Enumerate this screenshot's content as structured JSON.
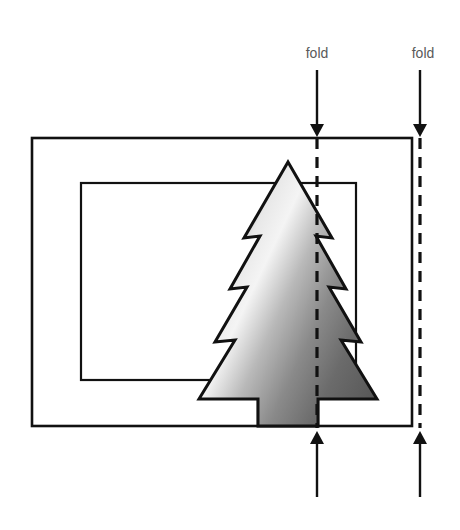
{
  "diagram": {
    "background_color": "#ffffff",
    "stroke_color": "#111111",
    "label_color": "#5a5a5a",
    "labels": [
      {
        "name": "fold-label-left",
        "text": "fold",
        "x": 317,
        "y": 58
      },
      {
        "name": "fold-label-right",
        "text": "fold",
        "x": 423,
        "y": 58
      }
    ],
    "fold_lines": [
      {
        "name": "fold-line-left",
        "x": 317,
        "y_top": 138,
        "y_bottom": 428,
        "dash": "10 7"
      },
      {
        "name": "fold-line-right",
        "x": 420,
        "y_top": 138,
        "y_bottom": 428,
        "dash": "10 7"
      }
    ],
    "arrows": {
      "top": [
        {
          "name": "fold-arrow-top-left",
          "x": 317,
          "y_start": 70,
          "y_end": 137
        },
        {
          "name": "fold-arrow-top-right",
          "x": 420,
          "y_start": 70,
          "y_end": 137
        }
      ],
      "bottom": [
        {
          "name": "fold-arrow-bottom-left",
          "x": 317,
          "y_start": 497,
          "y_end": 430
        },
        {
          "name": "fold-arrow-bottom-right",
          "x": 420,
          "y_start": 497,
          "y_end": 430
        }
      ]
    },
    "outer_rectangle": {
      "x": 32,
      "y": 138,
      "width": 380,
      "height": 288
    },
    "inner_rectangle": {
      "x": 81,
      "y": 183,
      "width": 275,
      "height": 197
    },
    "tree": {
      "tiers": 5,
      "trunk": {
        "x": 258,
        "y": 372,
        "width": 60,
        "height": 54
      },
      "apex": {
        "x": 288,
        "y": 162
      },
      "gradient": {
        "dark": "#4b4b4b",
        "mid": "#9a9a9a",
        "light": "#f2f2f2",
        "shadow": "#6f6f6f"
      }
    }
  }
}
